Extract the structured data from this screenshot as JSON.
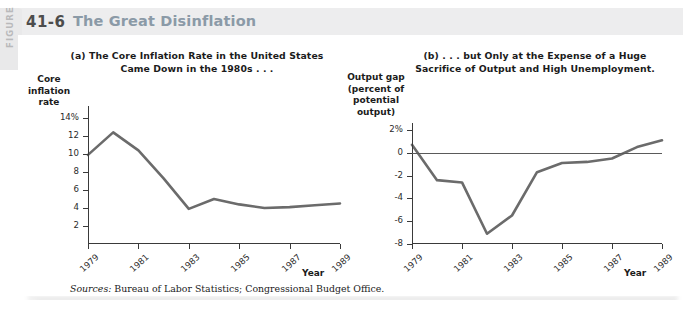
{
  "figure": {
    "tab_label": "FIGURE",
    "number": "41-6",
    "title": "The Great Disinflation",
    "sources_keyword": "Sources:",
    "sources_text": " Bureau of Labor Statistics; Congressional Budget Office.",
    "colors": {
      "title": "#8b9aa7",
      "header_band": "#ededee",
      "tab": "#e9e9ea",
      "tab_text": "#b9b9bb",
      "line": "#6b6b6b",
      "axis": "#3a3a3a",
      "text": "#1b1b1b",
      "background": "#ffffff"
    }
  },
  "chart_data": [
    {
      "type": "line",
      "panel": "a",
      "title": "(a) The Core Inflation Rate in the United States Came Down in the 1980s . . .",
      "title_line1": "(a) The Core Inflation Rate in the United States",
      "title_line2": "Came Down in the 1980s . . .",
      "ylabel": "Core inflation rate",
      "ylabel_line1": "Core",
      "ylabel_line2": "inflation",
      "ylabel_line3": "rate",
      "xlabel": "Year",
      "grid": false,
      "legend": "none",
      "xlim": [
        1979,
        1989
      ],
      "ylim": [
        0,
        14
      ],
      "ytick_labels": [
        "14%",
        "12",
        "10",
        "8",
        "6",
        "4",
        "2"
      ],
      "ytick_values": [
        14,
        12,
        10,
        8,
        6,
        4,
        2
      ],
      "xtick_labels": [
        "1979",
        "1981",
        "1983",
        "1985",
        "1987",
        "1989"
      ],
      "xtick_values": [
        1979,
        1981,
        1983,
        1985,
        1987,
        1989
      ],
      "x": [
        1979,
        1980,
        1981,
        1982,
        1983,
        1984,
        1985,
        1986,
        1987,
        1988,
        1989
      ],
      "values": [
        9.9,
        12.4,
        10.4,
        7.3,
        3.9,
        5.0,
        4.4,
        4.0,
        4.1,
        4.3,
        4.5
      ],
      "series_name": "Core inflation rate"
    },
    {
      "type": "line",
      "panel": "b",
      "title": "(b) . . . but Only at the Expense of a Huge Sacrifice of Output and High Unemployment.",
      "title_line1": "(b) . . . but Only at the Expense of a Huge",
      "title_line2": "Sacrifice of Output and High Unemployment.",
      "ylabel": "Output gap (percent of potential output)",
      "ylabel_line1": "Output gap",
      "ylabel_line2": "(percent of",
      "ylabel_line3": "potential",
      "ylabel_line4": "output)",
      "xlabel": "Year",
      "grid": false,
      "legend": "none",
      "zero_line": true,
      "xlim": [
        1979,
        1989
      ],
      "ylim": [
        -8,
        2
      ],
      "ytick_labels": [
        "2%",
        "0",
        "-2",
        "-4",
        "-6",
        "-8"
      ],
      "ytick_values": [
        2,
        0,
        -2,
        -4,
        -6,
        -8
      ],
      "xtick_labels": [
        "1979",
        "1981",
        "1983",
        "1985",
        "1987",
        "1989"
      ],
      "xtick_values": [
        1979,
        1981,
        1983,
        1985,
        1987,
        1989
      ],
      "x": [
        1979,
        1980,
        1981,
        1982,
        1983,
        1984,
        1985,
        1986,
        1987,
        1988,
        1989
      ],
      "values": [
        0.7,
        -2.4,
        -2.6,
        -7.1,
        -5.5,
        -1.7,
        -0.9,
        -0.8,
        -0.5,
        0.5,
        1.1
      ],
      "series_name": "Output gap"
    }
  ]
}
